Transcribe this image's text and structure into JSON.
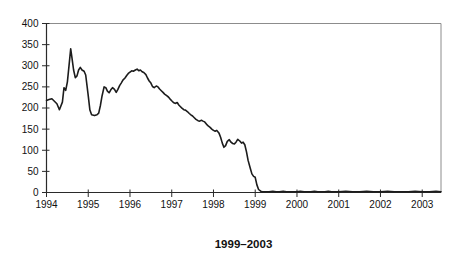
{
  "chart_data": {
    "type": "line",
    "title": "",
    "xlabel": "",
    "ylabel": "",
    "caption": "1999–2003",
    "legend": "none",
    "grid": false,
    "frame": "full-box",
    "xlim": [
      1994,
      2003.45
    ],
    "ylim": [
      0,
      400
    ],
    "x_ticks": [
      1994,
      1995,
      1996,
      1997,
      1998,
      1999,
      2000,
      2001,
      2002,
      2003
    ],
    "y_ticks": [
      0,
      50,
      100,
      150,
      200,
      250,
      300,
      350,
      400
    ],
    "colors": {
      "line": "#1c1c1c",
      "axis": "#2a2a2a",
      "frame": "#8c8c8c",
      "text": "#111111",
      "background": "#ffffff"
    },
    "series": [
      {
        "name": "series-1",
        "x": [
          1994.0,
          1994.06,
          1994.13,
          1994.19,
          1994.25,
          1994.31,
          1994.38,
          1994.42,
          1994.46,
          1994.5,
          1994.54,
          1994.58,
          1994.61,
          1994.65,
          1994.69,
          1994.73,
          1994.77,
          1994.81,
          1994.85,
          1994.9,
          1994.94,
          1995.0,
          1995.04,
          1995.08,
          1995.15,
          1995.21,
          1995.25,
          1995.29,
          1995.33,
          1995.38,
          1995.42,
          1995.46,
          1995.5,
          1995.54,
          1995.58,
          1995.63,
          1995.67,
          1995.71,
          1995.75,
          1995.79,
          1995.83,
          1995.88,
          1995.92,
          1995.96,
          1996.0,
          1996.04,
          1996.08,
          1996.13,
          1996.17,
          1996.21,
          1996.25,
          1996.29,
          1996.33,
          1996.38,
          1996.42,
          1996.46,
          1996.5,
          1996.54,
          1996.58,
          1996.63,
          1996.67,
          1996.71,
          1996.75,
          1996.79,
          1996.83,
          1996.88,
          1996.92,
          1996.96,
          1997.0,
          1997.04,
          1997.08,
          1997.13,
          1997.17,
          1997.21,
          1997.25,
          1997.29,
          1997.33,
          1997.38,
          1997.42,
          1997.46,
          1997.5,
          1997.54,
          1997.58,
          1997.63,
          1997.67,
          1997.71,
          1997.75,
          1997.79,
          1997.83,
          1997.88,
          1997.92,
          1997.96,
          1998.0,
          1998.04,
          1998.08,
          1998.13,
          1998.17,
          1998.21,
          1998.25,
          1998.29,
          1998.33,
          1998.38,
          1998.42,
          1998.46,
          1998.5,
          1998.54,
          1998.58,
          1998.63,
          1998.67,
          1998.71,
          1998.75,
          1998.79,
          1998.83,
          1998.88,
          1998.92,
          1998.96,
          1999.0,
          1999.04,
          1999.08,
          1999.13,
          1999.17,
          1999.25,
          1999.33,
          1999.42,
          1999.5,
          1999.58,
          1999.67,
          1999.75,
          1999.83,
          1999.92,
          2000.0,
          2000.08,
          2000.17,
          2000.25,
          2000.33,
          2000.42,
          2000.5,
          2000.58,
          2000.67,
          2000.75,
          2000.83,
          2000.92,
          2001.0,
          2001.17,
          2001.33,
          2001.5,
          2001.67,
          2001.83,
          2002.0,
          2002.17,
          2002.33,
          2002.5,
          2002.67,
          2002.83,
          2003.0,
          2003.17,
          2003.33,
          2003.45
        ],
        "values": [
          218,
          220,
          222,
          216,
          210,
          196,
          214,
          248,
          242,
          262,
          300,
          340,
          318,
          290,
          272,
          276,
          290,
          296,
          290,
          287,
          278,
          230,
          195,
          184,
          182,
          184,
          188,
          206,
          228,
          250,
          248,
          240,
          236,
          243,
          248,
          244,
          237,
          244,
          253,
          259,
          266,
          271,
          277,
          282,
          285,
          288,
          287,
          290,
          292,
          288,
          290,
          286,
          284,
          279,
          271,
          264,
          259,
          251,
          248,
          252,
          250,
          245,
          241,
          237,
          233,
          229,
          226,
          221,
          217,
          213,
          211,
          213,
          207,
          203,
          199,
          196,
          195,
          191,
          187,
          184,
          181,
          177,
          173,
          170,
          169,
          171,
          169,
          167,
          162,
          157,
          154,
          150,
          147,
          145,
          147,
          141,
          131,
          117,
          107,
          111,
          121,
          125,
          119,
          116,
          115,
          119,
          126,
          122,
          117,
          119,
          113,
          96,
          76,
          58,
          44,
          38,
          36,
          18,
          7,
          3,
          2,
          2,
          2,
          3,
          2,
          2,
          3,
          2,
          2,
          2,
          2,
          3,
          2,
          2,
          2,
          3,
          2,
          2,
          2,
          3,
          2,
          2,
          2,
          3,
          2,
          2,
          3,
          2,
          2,
          3,
          2,
          2,
          2,
          3,
          2,
          2,
          3,
          2
        ]
      }
    ]
  }
}
